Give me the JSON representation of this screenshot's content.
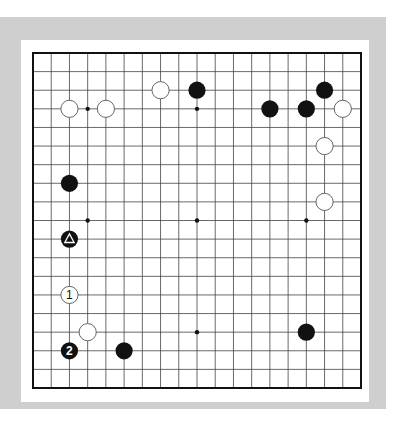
{
  "diagram": {
    "type": "go-board",
    "size": 19,
    "colors": {
      "frame": "#cfcfcf",
      "panel": "#ffffff",
      "line": "#444444",
      "black": "#111111",
      "white": "#ffffff"
    },
    "hoshi": [
      [
        3,
        3
      ],
      [
        9,
        3
      ],
      [
        15,
        3
      ],
      [
        3,
        9
      ],
      [
        9,
        9
      ],
      [
        15,
        9
      ],
      [
        3,
        15
      ],
      [
        9,
        15
      ],
      [
        15,
        15
      ]
    ],
    "stones": [
      {
        "color": "white",
        "col": 2,
        "row": 3
      },
      {
        "color": "white",
        "col": 4,
        "row": 3
      },
      {
        "color": "white",
        "col": 7,
        "row": 2
      },
      {
        "color": "black",
        "col": 9,
        "row": 2
      },
      {
        "color": "black",
        "col": 13,
        "row": 3
      },
      {
        "color": "black",
        "col": 15,
        "row": 3
      },
      {
        "color": "black",
        "col": 16,
        "row": 2
      },
      {
        "color": "white",
        "col": 17,
        "row": 3
      },
      {
        "color": "white",
        "col": 16,
        "row": 5
      },
      {
        "color": "white",
        "col": 16,
        "row": 8
      },
      {
        "color": "black",
        "col": 2,
        "row": 7
      },
      {
        "color": "black",
        "col": 2,
        "row": 10,
        "marker": "triangle"
      },
      {
        "color": "white",
        "col": 2,
        "row": 13,
        "label": "1"
      },
      {
        "color": "white",
        "col": 3,
        "row": 15
      },
      {
        "color": "black",
        "col": 2,
        "row": 16,
        "label": "2"
      },
      {
        "color": "black",
        "col": 5,
        "row": 16
      },
      {
        "color": "black",
        "col": 15,
        "row": 15
      }
    ]
  }
}
